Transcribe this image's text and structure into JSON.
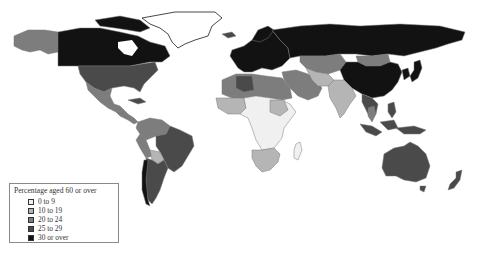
{
  "map": {
    "type": "choropleth",
    "subject": "Percentage of population aged 60 or over by country",
    "colors": {
      "0_to_9": "#f0f0f0",
      "10_to_19": "#b5b5b5",
      "20_to_24": "#7d7d7d",
      "25_to_29": "#4a4a4a",
      "30_or_over": "#121212",
      "ocean": "#ffffff",
      "border": "#7a7a7a"
    }
  },
  "legend": {
    "title": "Percentage aged 60 or over",
    "items": [
      {
        "label": "0 to 9",
        "color": "#f0f0f0"
      },
      {
        "label": "10 to 19",
        "color": "#b5b5b5"
      },
      {
        "label": "20 to 24",
        "color": "#7d7d7d"
      },
      {
        "label": "25 to 29",
        "color": "#4a4a4a"
      },
      {
        "label": "30 or over",
        "color": "#121212"
      }
    ]
  },
  "regions": [
    {
      "name": "Alaska",
      "class": "20 to 24"
    },
    {
      "name": "Canada",
      "class": "30 or over"
    },
    {
      "name": "United States",
      "class": "25 to 29"
    },
    {
      "name": "Mexico",
      "class": "20 to 24"
    },
    {
      "name": "Central America",
      "class": "20 to 24"
    },
    {
      "name": "Northern South America",
      "class": "20 to 24"
    },
    {
      "name": "Brazil",
      "class": "25 to 29"
    },
    {
      "name": "Bolivia",
      "class": "10 to 19"
    },
    {
      "name": "Southern Cone",
      "class": "25 to 29"
    },
    {
      "name": "Greenland",
      "class": "0 to 9"
    },
    {
      "name": "Europe",
      "class": "30 or over"
    },
    {
      "name": "Russia",
      "class": "30 or over"
    },
    {
      "name": "Kazakhstan / Central Asia",
      "class": "20 to 24"
    },
    {
      "name": "Mongolia",
      "class": "20 to 24"
    },
    {
      "name": "China",
      "class": "30 or over"
    },
    {
      "name": "Japan",
      "class": "30 or over"
    },
    {
      "name": "Korea",
      "class": "30 or over"
    },
    {
      "name": "North Africa",
      "class": "20 to 24"
    },
    {
      "name": "Middle East",
      "class": "20 to 24"
    },
    {
      "name": "India",
      "class": "10 to 19"
    },
    {
      "name": "Southeast Asia",
      "class": "25 to 29"
    },
    {
      "name": "Indonesia",
      "class": "25 to 29"
    },
    {
      "name": "Sub-Saharan Africa",
      "class": "0 to 9"
    },
    {
      "name": "Southern Africa",
      "class": "10 to 19"
    },
    {
      "name": "Madagascar",
      "class": "0 to 9"
    },
    {
      "name": "Australia",
      "class": "25 to 29"
    },
    {
      "name": "New Zealand",
      "class": "25 to 29"
    }
  ]
}
